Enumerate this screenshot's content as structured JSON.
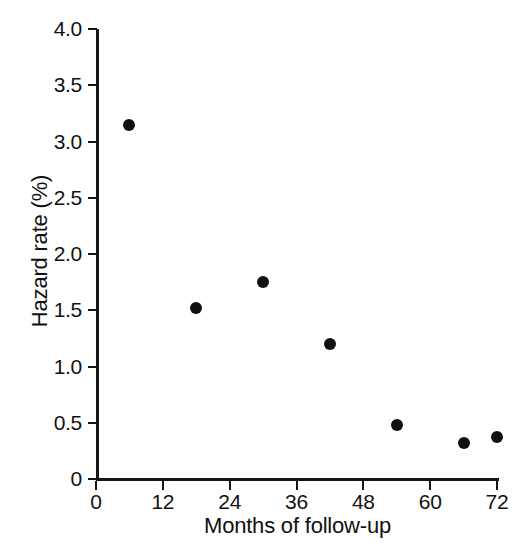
{
  "chart_data": {
    "type": "scatter",
    "title": "",
    "xlabel": "Months of follow-up",
    "ylabel": "Hazard rate (%)",
    "xlim": [
      0,
      72
    ],
    "ylim": [
      0,
      4.0
    ],
    "grid": false,
    "legend": false,
    "x": [
      6,
      18,
      30,
      42,
      54,
      66,
      72
    ],
    "values": [
      3.15,
      1.52,
      1.75,
      1.2,
      0.48,
      0.32,
      0.37
    ],
    "points": [
      {
        "x": 6,
        "y": 3.15
      },
      {
        "x": 18,
        "y": 1.52
      },
      {
        "x": 30,
        "y": 1.75
      },
      {
        "x": 42,
        "y": 1.2
      },
      {
        "x": 54,
        "y": 0.48
      },
      {
        "x": 66,
        "y": 0.32
      },
      {
        "x": 72,
        "y": 0.37
      }
    ],
    "xticks": [
      0,
      12,
      24,
      36,
      48,
      60,
      72
    ],
    "xticklabels": [
      "0",
      "12",
      "24",
      "36",
      "48",
      "60",
      "72"
    ],
    "yticks": [
      0,
      0.5,
      1.0,
      1.5,
      2.0,
      2.5,
      3.0,
      3.5,
      4.0
    ],
    "yticklabels": [
      "0",
      "0.5",
      "1.0",
      "1.5",
      "2.0",
      "2.5",
      "3.0",
      "3.5",
      "4.0"
    ],
    "marker": "filled-circle",
    "marker_color": "#101010",
    "axis_color": "#161616",
    "background_color": "#ffffff"
  }
}
